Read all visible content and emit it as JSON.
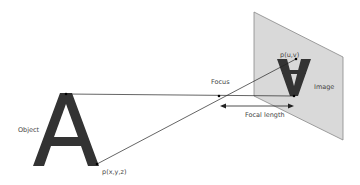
{
  "diagram": {
    "labels": {
      "object": "Object",
      "object_point": "p(x,y,z)",
      "focus": "Focus",
      "image_point": "p(u,v)",
      "image": "Image",
      "focal_length": "Focal length"
    },
    "glyph": "A",
    "colors": {
      "letter": "#333333",
      "plane_fill": "#d9d9d9",
      "plane_stroke": "#888888",
      "line": "#222222"
    }
  }
}
